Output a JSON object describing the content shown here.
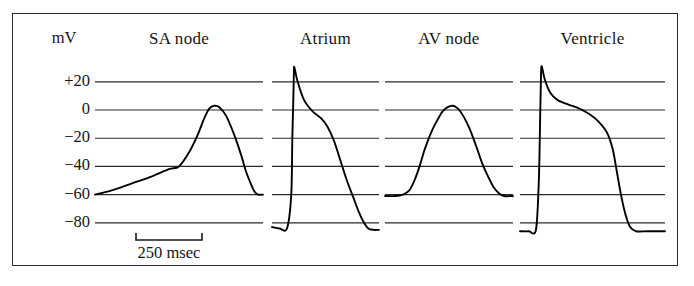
{
  "figure": {
    "units_label": "mV",
    "scale_bar": {
      "label": "250 msec",
      "x_start": 136,
      "x_end": 202,
      "y": 240
    },
    "frame": {
      "x": 12,
      "y": 13,
      "width": 666,
      "height": 253
    }
  },
  "chart_data": {
    "type": "line",
    "title": "",
    "xlabel": "",
    "ylabel": "mV",
    "ylim": [
      -90,
      40
    ],
    "yticks": [
      20,
      0,
      -20,
      -40,
      -60,
      -80
    ],
    "ytick_labels": [
      "+20",
      "0",
      "-20",
      "-40",
      "-60",
      "-80"
    ],
    "grid": true,
    "legend": "none",
    "time_scale_bar_msec": 250,
    "panels": [
      {
        "name": "SA node",
        "label": "SA node",
        "resting_mV": -60,
        "peak_mV": 3,
        "x_px": [
          95,
          263
        ],
        "points_mV": [
          [
            0.0,
            -60
          ],
          [
            0.1,
            -57
          ],
          [
            0.22,
            -52
          ],
          [
            0.34,
            -47
          ],
          [
            0.44,
            -42
          ],
          [
            0.5,
            -40
          ],
          [
            0.56,
            -30
          ],
          [
            0.61,
            -18
          ],
          [
            0.65,
            -6
          ],
          [
            0.68,
            1
          ],
          [
            0.71,
            3
          ],
          [
            0.74,
            2
          ],
          [
            0.78,
            -4
          ],
          [
            0.83,
            -18
          ],
          [
            0.87,
            -32
          ],
          [
            0.9,
            -44
          ],
          [
            0.93,
            -53
          ],
          [
            0.95,
            -58
          ],
          [
            0.97,
            -60
          ],
          [
            1.0,
            -60
          ]
        ]
      },
      {
        "name": "Atrium",
        "label": "Atrium",
        "resting_mV": -83,
        "peak_mV": 30,
        "x_px": [
          272,
          379
        ],
        "points_mV": [
          [
            0.0,
            -83
          ],
          [
            0.07,
            -84
          ],
          [
            0.14,
            -84
          ],
          [
            0.18,
            -60
          ],
          [
            0.19,
            -20
          ],
          [
            0.2,
            10
          ],
          [
            0.205,
            28
          ],
          [
            0.21,
            30
          ],
          [
            0.24,
            20
          ],
          [
            0.3,
            7
          ],
          [
            0.38,
            -1
          ],
          [
            0.46,
            -6
          ],
          [
            0.52,
            -12
          ],
          [
            0.58,
            -22
          ],
          [
            0.64,
            -36
          ],
          [
            0.7,
            -50
          ],
          [
            0.76,
            -62
          ],
          [
            0.81,
            -72
          ],
          [
            0.86,
            -80
          ],
          [
            0.9,
            -84
          ],
          [
            0.95,
            -85
          ],
          [
            1.0,
            -85
          ]
        ]
      },
      {
        "name": "AV node",
        "label": "AV node",
        "resting_mV": -60,
        "peak_mV": 3,
        "x_px": [
          385,
          513
        ],
        "points_mV": [
          [
            0.0,
            -61
          ],
          [
            0.08,
            -61
          ],
          [
            0.14,
            -60
          ],
          [
            0.19,
            -57
          ],
          [
            0.23,
            -50
          ],
          [
            0.27,
            -40
          ],
          [
            0.31,
            -28
          ],
          [
            0.36,
            -16
          ],
          [
            0.41,
            -7
          ],
          [
            0.45,
            -1
          ],
          [
            0.49,
            2
          ],
          [
            0.53,
            3
          ],
          [
            0.57,
            1
          ],
          [
            0.61,
            -4
          ],
          [
            0.66,
            -13
          ],
          [
            0.71,
            -25
          ],
          [
            0.76,
            -38
          ],
          [
            0.81,
            -48
          ],
          [
            0.85,
            -55
          ],
          [
            0.89,
            -59
          ],
          [
            0.93,
            -61
          ],
          [
            1.0,
            -61
          ]
        ]
      },
      {
        "name": "Ventricle",
        "label": "Ventricle",
        "resting_mV": -85,
        "peak_mV": 30,
        "x_px": [
          520,
          665
        ],
        "points_mV": [
          [
            0.0,
            -86
          ],
          [
            0.06,
            -86
          ],
          [
            0.11,
            -85
          ],
          [
            0.13,
            -50
          ],
          [
            0.14,
            0
          ],
          [
            0.145,
            25
          ],
          [
            0.15,
            31
          ],
          [
            0.17,
            22
          ],
          [
            0.21,
            12
          ],
          [
            0.26,
            7
          ],
          [
            0.33,
            4
          ],
          [
            0.41,
            1
          ],
          [
            0.48,
            -3
          ],
          [
            0.54,
            -8
          ],
          [
            0.6,
            -16
          ],
          [
            0.64,
            -28
          ],
          [
            0.67,
            -45
          ],
          [
            0.7,
            -62
          ],
          [
            0.73,
            -75
          ],
          [
            0.76,
            -83
          ],
          [
            0.8,
            -86
          ],
          [
            0.88,
            -86
          ],
          [
            1.0,
            -86
          ]
        ]
      }
    ]
  }
}
